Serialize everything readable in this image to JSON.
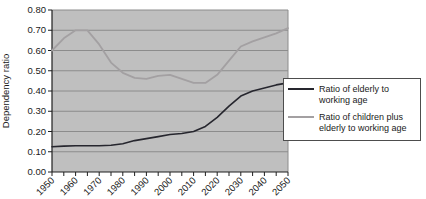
{
  "chart_data": {
    "type": "line",
    "title": "",
    "xlabel": "",
    "ylabel": "Dependency ratio",
    "ylim": [
      0.0,
      0.8
    ],
    "ytick_step": 0.1,
    "ytick_labels": [
      "0.00",
      "0.10",
      "0.20",
      "0.30",
      "0.40",
      "0.50",
      "0.60",
      "0.70",
      "0.80"
    ],
    "x": [
      1950,
      1955,
      1960,
      1965,
      1970,
      1975,
      1980,
      1985,
      1990,
      1995,
      2000,
      2005,
      2010,
      2015,
      2020,
      2025,
      2030,
      2035,
      2040,
      2045,
      2050
    ],
    "xtick_labels": [
      "1950",
      "1960",
      "1970",
      "1980",
      "1990",
      "2000",
      "2010",
      "2020",
      "2030",
      "2040",
      "2050"
    ],
    "grid": "horizontal",
    "legend_position": "right",
    "colors": {
      "plot_bg": "#bfbfbf",
      "grid": "#8c8c8c",
      "axis": "#1f1f1f",
      "legend_border": "#4d4d4d"
    },
    "series": [
      {
        "name": "Ratio of elderly to working age",
        "color": "#26262e",
        "values": [
          0.125,
          0.128,
          0.13,
          0.13,
          0.13,
          0.132,
          0.14,
          0.155,
          0.165,
          0.175,
          0.185,
          0.19,
          0.2,
          0.225,
          0.27,
          0.325,
          0.375,
          0.4,
          0.415,
          0.43,
          0.44
        ]
      },
      {
        "name": "Ratio of children plus elderly to working age",
        "color": "#a3a0a2",
        "values": [
          0.6,
          0.66,
          0.7,
          0.7,
          0.63,
          0.54,
          0.49,
          0.465,
          0.46,
          0.475,
          0.48,
          0.46,
          0.44,
          0.44,
          0.48,
          0.55,
          0.62,
          0.645,
          0.665,
          0.685,
          0.71
        ]
      }
    ]
  }
}
